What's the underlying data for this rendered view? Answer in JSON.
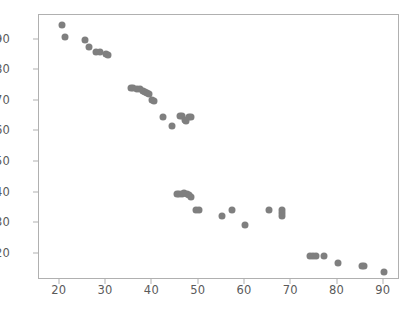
{
  "chart_data": {
    "type": "scatter",
    "title": "",
    "xlabel": "",
    "ylabel": "",
    "xlim": [
      15.5,
      93.5
    ],
    "ylim": [
      11.5,
      98.0
    ],
    "grid": false,
    "legend": null,
    "marker": {
      "color": "#7f7f7f",
      "shape": "circle",
      "size": 7,
      "alpha": 0.85
    },
    "xticks": [
      20,
      30,
      40,
      50,
      60,
      70,
      80,
      90
    ],
    "yticks": [
      20,
      30,
      40,
      50,
      60,
      70,
      80,
      90
    ],
    "xtick_labels": [
      "20",
      "30",
      "40",
      "50",
      "60",
      "70",
      "80",
      "90"
    ],
    "ytick_labels": [
      "20",
      "30",
      "40",
      "50",
      "60",
      "70",
      "80",
      "90"
    ],
    "n_points": 52,
    "points": [
      {
        "x": 20.4,
        "y": 94.7
      },
      {
        "x": 21.1,
        "y": 90.7
      },
      {
        "x": 25.4,
        "y": 89.7
      },
      {
        "x": 26.2,
        "y": 87.7
      },
      {
        "x": 27.9,
        "y": 86.0
      },
      {
        "x": 28.6,
        "y": 86.0
      },
      {
        "x": 30.0,
        "y": 85.3
      },
      {
        "x": 30.5,
        "y": 85.0
      },
      {
        "x": 35.3,
        "y": 74.3
      },
      {
        "x": 35.9,
        "y": 74.3
      },
      {
        "x": 36.6,
        "y": 74.0
      },
      {
        "x": 37.3,
        "y": 73.7
      },
      {
        "x": 37.9,
        "y": 73.3
      },
      {
        "x": 38.4,
        "y": 73.0
      },
      {
        "x": 38.9,
        "y": 72.7
      },
      {
        "x": 39.3,
        "y": 72.3
      },
      {
        "x": 39.9,
        "y": 70.3
      },
      {
        "x": 40.3,
        "y": 70.0
      },
      {
        "x": 42.4,
        "y": 64.7
      },
      {
        "x": 44.2,
        "y": 61.7
      },
      {
        "x": 46.0,
        "y": 65.0
      },
      {
        "x": 46.5,
        "y": 65.0
      },
      {
        "x": 47.1,
        "y": 63.7
      },
      {
        "x": 47.3,
        "y": 63.3
      },
      {
        "x": 47.9,
        "y": 64.7
      },
      {
        "x": 48.4,
        "y": 64.7
      },
      {
        "x": 45.3,
        "y": 39.7
      },
      {
        "x": 45.8,
        "y": 39.7
      },
      {
        "x": 46.3,
        "y": 39.7
      },
      {
        "x": 46.9,
        "y": 40.0
      },
      {
        "x": 47.4,
        "y": 39.7
      },
      {
        "x": 47.9,
        "y": 39.3
      },
      {
        "x": 48.4,
        "y": 38.7
      },
      {
        "x": 49.4,
        "y": 34.3
      },
      {
        "x": 50.0,
        "y": 34.3
      },
      {
        "x": 55.1,
        "y": 32.3
      },
      {
        "x": 57.3,
        "y": 34.3
      },
      {
        "x": 60.0,
        "y": 29.3
      },
      {
        "x": 65.2,
        "y": 34.3
      },
      {
        "x": 67.9,
        "y": 34.3
      },
      {
        "x": 68.1,
        "y": 33.3
      },
      {
        "x": 68.1,
        "y": 32.3
      },
      {
        "x": 74.0,
        "y": 19.3
      },
      {
        "x": 74.6,
        "y": 19.3
      },
      {
        "x": 75.3,
        "y": 19.3
      },
      {
        "x": 77.1,
        "y": 19.3
      },
      {
        "x": 80.0,
        "y": 17.0
      },
      {
        "x": 85.2,
        "y": 16.0
      },
      {
        "x": 85.8,
        "y": 16.0
      },
      {
        "x": 90.0,
        "y": 14.0
      }
    ]
  },
  "axes": {
    "frame_color": "#b0b0b0",
    "tick_color": "#5a5a5a"
  }
}
